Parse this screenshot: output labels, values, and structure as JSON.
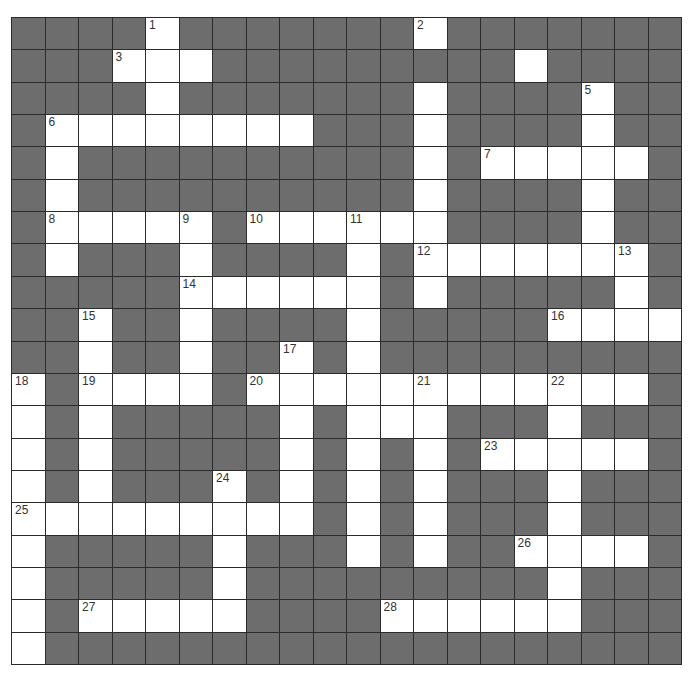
{
  "puzzle": {
    "rows": 20,
    "cols": 20,
    "colors": {
      "dark_cell": "#6d6d6d",
      "white_cell": "#ffffff",
      "grid_line": "#2b2b2b",
      "number_text": "#333333"
    },
    "grid": [
      "####.#######.#######",
      "###...#########.####",
      "####.#######.####.##",
      "#........###.####.##",
      "#.##########.#.....#",
      "#.##########.####.##",
      "#.....#......####.##",
      "#.###.####.#.......#",
      "#####......#.#####.#",
      "##.##.####.#####....",
      "##.##.##.#.#########",
      ".#....#............#",
      ".#.#####.#...###.###",
      ".#.#####.#.#.#.....#",
      ".#.###.#.#.#.###.###",
      ".........#.#.###.###",
      ".#####.###.#.##....#",
      ".#####.#########.###",
      ".#.....####......###",
      ".###################"
    ],
    "numbers": [
      {
        "n": "1",
        "row": 0,
        "col": 4
      },
      {
        "n": "2",
        "row": 0,
        "col": 12
      },
      {
        "n": "3",
        "row": 1,
        "col": 3
      },
      {
        "n": "4",
        "row": 1,
        "col": 7
      },
      {
        "n": "5",
        "row": 2,
        "col": 17
      },
      {
        "n": "6",
        "row": 3,
        "col": 1
      },
      {
        "n": "7",
        "row": 4,
        "col": 14
      },
      {
        "n": "8",
        "row": 6,
        "col": 1
      },
      {
        "n": "9",
        "row": 6,
        "col": 5
      },
      {
        "n": "10",
        "row": 6,
        "col": 7
      },
      {
        "n": "11",
        "row": 6,
        "col": 10
      },
      {
        "n": "12",
        "row": 7,
        "col": 12
      },
      {
        "n": "13",
        "row": 7,
        "col": 18
      },
      {
        "n": "14",
        "row": 8,
        "col": 5
      },
      {
        "n": "15",
        "row": 9,
        "col": 2
      },
      {
        "n": "16",
        "row": 9,
        "col": 16
      },
      {
        "n": "17",
        "row": 10,
        "col": 8
      },
      {
        "n": "18",
        "row": 11,
        "col": 0
      },
      {
        "n": "19",
        "row": 11,
        "col": 2
      },
      {
        "n": "20",
        "row": 11,
        "col": 7
      },
      {
        "n": "21",
        "row": 11,
        "col": 12
      },
      {
        "n": "22",
        "row": 11,
        "col": 16
      },
      {
        "n": "23",
        "row": 13,
        "col": 14
      },
      {
        "n": "24",
        "row": 14,
        "col": 6
      },
      {
        "n": "25",
        "row": 15,
        "col": 0
      },
      {
        "n": "26",
        "row": 16,
        "col": 15
      },
      {
        "n": "27",
        "row": 18,
        "col": 2
      },
      {
        "n": "28",
        "row": 18,
        "col": 11
      }
    ],
    "across": [
      {
        "n": "3",
        "length": 3
      },
      {
        "n": "4",
        "length": 8
      },
      {
        "n": "6",
        "length": 8
      },
      {
        "n": "7",
        "length": 5
      },
      {
        "n": "8",
        "length": 5
      },
      {
        "n": "10",
        "length": 6
      },
      {
        "n": "12",
        "length": 7
      },
      {
        "n": "14",
        "length": 6
      },
      {
        "n": "16",
        "length": 4
      },
      {
        "n": "19",
        "length": 4
      },
      {
        "n": "20",
        "length": 12
      },
      {
        "n": "23",
        "length": 5
      },
      {
        "n": "25",
        "length": 9
      },
      {
        "n": "26",
        "length": 4
      },
      {
        "n": "27",
        "length": 5
      },
      {
        "n": "28",
        "length": 6
      }
    ],
    "down": [
      {
        "n": "1",
        "length": 3
      },
      {
        "n": "2",
        "length": 9
      },
      {
        "n": "5",
        "length": 6
      },
      {
        "n": "6",
        "length": 5
      },
      {
        "n": "9",
        "length": 6
      },
      {
        "n": "11",
        "length": 11
      },
      {
        "n": "13",
        "length": 3
      },
      {
        "n": "15",
        "length": 7
      },
      {
        "n": "17",
        "length": 6
      },
      {
        "n": "18",
        "length": 9
      },
      {
        "n": "21",
        "length": 6
      },
      {
        "n": "22",
        "length": 8
      },
      {
        "n": "24",
        "length": 5
      }
    ]
  }
}
